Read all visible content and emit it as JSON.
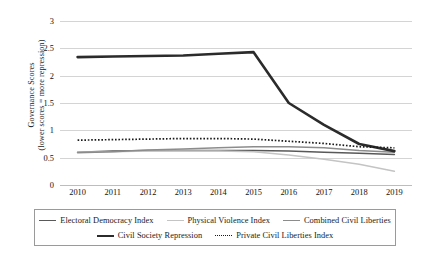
{
  "chart_data": {
    "type": "line",
    "title": "",
    "xlabel": "",
    "ylabel": "Governance Scores (lower scores = more repression)",
    "ylabel_line1": "Governance Scores",
    "ylabel_line2": "(lower scores = more repression)",
    "categories": [
      "2010",
      "2011",
      "2012",
      "2013",
      "2014",
      "2015",
      "2016",
      "2017",
      "2018",
      "2019"
    ],
    "x": [
      2010,
      2011,
      2012,
      2013,
      2014,
      2015,
      2016,
      2017,
      2018,
      2019
    ],
    "ylim": [
      0,
      3
    ],
    "yticks": [
      "0",
      "0.5",
      "1",
      "1.5",
      "2",
      "2.5",
      "3"
    ],
    "ytick_values": [
      0,
      0.5,
      1,
      1.5,
      2,
      2.5,
      3
    ],
    "grid": true,
    "legend_position": "bottom",
    "series": [
      {
        "name": "Electoral Democracy Index",
        "color": "#595959",
        "width": 1.5,
        "dash": "none",
        "values": [
          0.6,
          0.62,
          0.63,
          0.63,
          0.63,
          0.63,
          0.62,
          0.6,
          0.58,
          0.56
        ]
      },
      {
        "name": "Physical Violence Index",
        "color": "#c4c4c4",
        "width": 1.5,
        "dash": "none",
        "values": [
          0.6,
          0.61,
          0.62,
          0.62,
          0.62,
          0.61,
          0.55,
          0.47,
          0.38,
          0.25
        ]
      },
      {
        "name": "Combined Civil Liberties",
        "color": "#8c8c8c",
        "width": 1.5,
        "dash": "none",
        "values": [
          0.59,
          0.61,
          0.64,
          0.66,
          0.68,
          0.7,
          0.7,
          0.68,
          0.63,
          0.6
        ]
      },
      {
        "name": "Civil Society Repression",
        "color": "#2b2b2b",
        "width": 2.6,
        "dash": "none",
        "values": [
          2.34,
          2.35,
          2.36,
          2.37,
          2.4,
          2.43,
          1.5,
          1.1,
          0.75,
          0.62
        ]
      },
      {
        "name": "Private Civil Liberties Index",
        "color": "#1a1a1a",
        "width": 1.7,
        "dash": "dotted",
        "values": [
          0.82,
          0.83,
          0.84,
          0.85,
          0.85,
          0.84,
          0.8,
          0.76,
          0.7,
          0.68
        ]
      }
    ]
  },
  "legend": {
    "row1": [
      "Electoral Democracy Index",
      "Physical Violence Index",
      "Combined Civil Liberties"
    ],
    "row2": [
      "Civil Society Repression",
      "Private Civil Liberties Index"
    ]
  }
}
